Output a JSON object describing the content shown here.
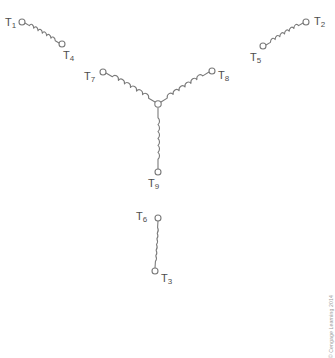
{
  "figure": {
    "kind": "electrical-schematic",
    "background_color": "#ffffff",
    "line_color": "#7a7a7a",
    "label_color": "#4d4d4d"
  },
  "credit": {
    "text": "© Cengage Learning 2014",
    "color": "#9a9a9a"
  },
  "terminals": [
    {
      "id": "T1",
      "base": "T",
      "sub": "1",
      "label_x": 5,
      "label_y": 17,
      "node_x": 22,
      "node_y": 22
    },
    {
      "id": "T4",
      "base": "T",
      "sub": "4",
      "label_x": 63,
      "label_y": 50,
      "node_x": 62,
      "node_y": 44
    },
    {
      "id": "T7",
      "base": "T",
      "sub": "7",
      "label_x": 84,
      "label_y": 71,
      "node_x": 103,
      "node_y": 72
    },
    {
      "id": "T8",
      "base": "T",
      "sub": "8",
      "label_x": 218,
      "label_y": 70,
      "node_x": 212,
      "node_y": 71
    },
    {
      "id": "T9",
      "base": "T",
      "sub": "9",
      "label_x": 148,
      "label_y": 178,
      "node_x": 158,
      "node_y": 172
    },
    {
      "id": "T5",
      "base": "T",
      "sub": "5",
      "label_x": 250,
      "label_y": 52,
      "node_x": 263,
      "node_y": 46
    },
    {
      "id": "T2",
      "base": "T",
      "sub": "2",
      "label_x": 314,
      "label_y": 16,
      "node_x": 306,
      "node_y": 22
    },
    {
      "id": "T6",
      "base": "T",
      "sub": "6",
      "label_x": 136,
      "label_y": 211,
      "node_x": 158,
      "node_y": 218
    },
    {
      "id": "T3",
      "base": "T",
      "sub": "3",
      "label_x": 161,
      "label_y": 273,
      "node_x": 155,
      "node_y": 271
    }
  ],
  "center_node": {
    "x": 158,
    "y": 104,
    "r": 3.2
  },
  "coils": [
    {
      "name": "coil-t1-t4",
      "from": "T1",
      "to": "T4",
      "x1": 25,
      "y1": 23,
      "x2": 59,
      "y2": 43,
      "turns": 6,
      "amp": 4.2,
      "lead_start": 0.13,
      "lead_end": 0.11
    },
    {
      "name": "coil-t7-center",
      "from": "T7",
      "to": "center",
      "x1": 106,
      "y1": 73,
      "x2": 155,
      "y2": 102,
      "turns": 6,
      "amp": 4.2,
      "lead_start": 0.13,
      "lead_end": 0.13
    },
    {
      "name": "coil-center-t8",
      "from": "center",
      "to": "T8",
      "x1": 161,
      "y1": 102,
      "x2": 209,
      "y2": 72,
      "turns": 6,
      "amp": 4.2,
      "lead_start": 0.13,
      "lead_end": 0.13
    },
    {
      "name": "coil-center-t9",
      "from": "center",
      "to": "T9",
      "x1": 158,
      "y1": 108,
      "x2": 158,
      "y2": 169,
      "turns": 6,
      "amp": 4.2,
      "lead_start": 0.16,
      "lead_end": 0.16
    },
    {
      "name": "coil-t5-t2",
      "from": "T5",
      "to": "T2",
      "x1": 266,
      "y1": 45,
      "x2": 303,
      "y2": 23,
      "turns": 6,
      "amp": 4.2,
      "lead_start": 0.12,
      "lead_end": 0.12
    },
    {
      "name": "coil-t6-t3",
      "from": "T6",
      "to": "T3",
      "x1": 158,
      "y1": 221,
      "x2": 155,
      "y2": 268,
      "turns": 6,
      "amp": 4.2,
      "lead_start": 0.14,
      "lead_end": 0.14
    }
  ],
  "terminal_radius": 3.0
}
